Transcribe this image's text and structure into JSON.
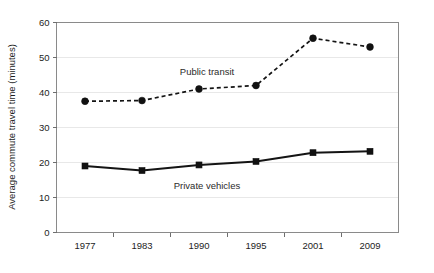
{
  "chart_data": {
    "type": "line",
    "title": "",
    "xlabel": "",
    "ylabel": "Average commute travel time (minutes)",
    "categories": [
      "1977",
      "1983",
      "1990",
      "1995",
      "2001",
      "2009"
    ],
    "ylim": [
      0,
      60
    ],
    "yticks": [
      0,
      10,
      20,
      30,
      40,
      50,
      60
    ],
    "ytick_labels": [
      "0",
      "10",
      "20",
      "30",
      "40",
      "50",
      "60"
    ],
    "grid": true,
    "legend_position": "inline-annotation",
    "series": [
      {
        "name": "Public transit",
        "values": [
          37.5,
          37.7,
          41.0,
          42.0,
          55.5,
          53.0
        ],
        "line_style": "dashed",
        "marker": "circle",
        "color": "#141414",
        "label_x": 207,
        "label_y": 75
      },
      {
        "name": "Private vehicles",
        "values": [
          19.0,
          17.7,
          19.3,
          20.3,
          22.8,
          23.2
        ],
        "line_style": "solid",
        "marker": "square",
        "color": "#141414",
        "label_x": 207,
        "label_y": 189
      }
    ]
  },
  "figure": {
    "background": "#ffffff",
    "grid_color": "#e8e8e8",
    "frame_color": "#8a8a8a",
    "text_color": "#1d1d1d"
  }
}
